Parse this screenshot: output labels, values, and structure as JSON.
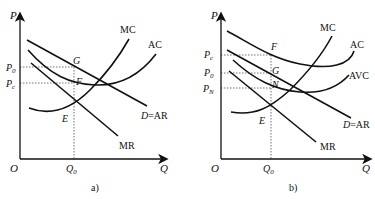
{
  "panels": [
    {
      "caption": "a)",
      "axes": {
        "y_label": "P",
        "x_label": "Q",
        "origin": "O"
      },
      "y_ticks": [
        {
          "main": "P",
          "sub": "0"
        },
        {
          "main": "P",
          "sub": "c"
        }
      ],
      "x_ticks": [
        {
          "main": "Q",
          "sub": "0"
        }
      ],
      "curve_labels": {
        "mc": "MC",
        "ac": "AC",
        "d_prefix": "D",
        "d_suffix": "=AR",
        "mr": "MR"
      },
      "points": {
        "g": "G",
        "f": "F",
        "e": "E"
      }
    },
    {
      "caption": "b)",
      "axes": {
        "y_label": "P",
        "x_label": "Q",
        "origin": "O"
      },
      "y_ticks": [
        {
          "main": "P",
          "sub": "c"
        },
        {
          "main": "P",
          "sub": "0"
        },
        {
          "main": "P",
          "sub": "N"
        }
      ],
      "x_ticks": [
        {
          "main": "Q",
          "sub": "0"
        }
      ],
      "curve_labels": {
        "mc": "MC",
        "ac": "AC",
        "avc": "AVC",
        "d_prefix": "D",
        "d_suffix": "=AR",
        "mr": "MR"
      },
      "points": {
        "f": "F",
        "g": "G",
        "n": "N",
        "e": "E"
      }
    }
  ]
}
